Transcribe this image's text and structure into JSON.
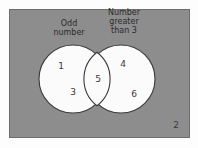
{
  "diagram": {
    "type": "venn",
    "universe_label": "",
    "colors": {
      "background": "#8d8d8d",
      "circle_fill": "#fbfbfb",
      "circle_stroke": "#3a3a3a",
      "text": "#2b2b2b",
      "page_background": "#fdfdfd"
    },
    "sets": [
      {
        "id": "left",
        "label_lines": [
          "Odd",
          "number"
        ],
        "label": "Odd number",
        "elements_only": [
          "1",
          "3"
        ]
      },
      {
        "id": "right",
        "label_lines": [
          "Number",
          "greater",
          "than 3"
        ],
        "label": "Number greater than 3",
        "elements_only": [
          "4",
          "6"
        ]
      }
    ],
    "intersection": {
      "elements": [
        "5"
      ]
    },
    "outside": {
      "elements": [
        "2"
      ]
    },
    "elements": {
      "one": "1",
      "two": "2",
      "three": "3",
      "four": "4",
      "five": "5",
      "six": "6"
    },
    "labels": {
      "left_line1": "Odd",
      "left_line2": "number",
      "right_line1": "Number",
      "right_line2": "greater",
      "right_line3": "than 3"
    }
  }
}
